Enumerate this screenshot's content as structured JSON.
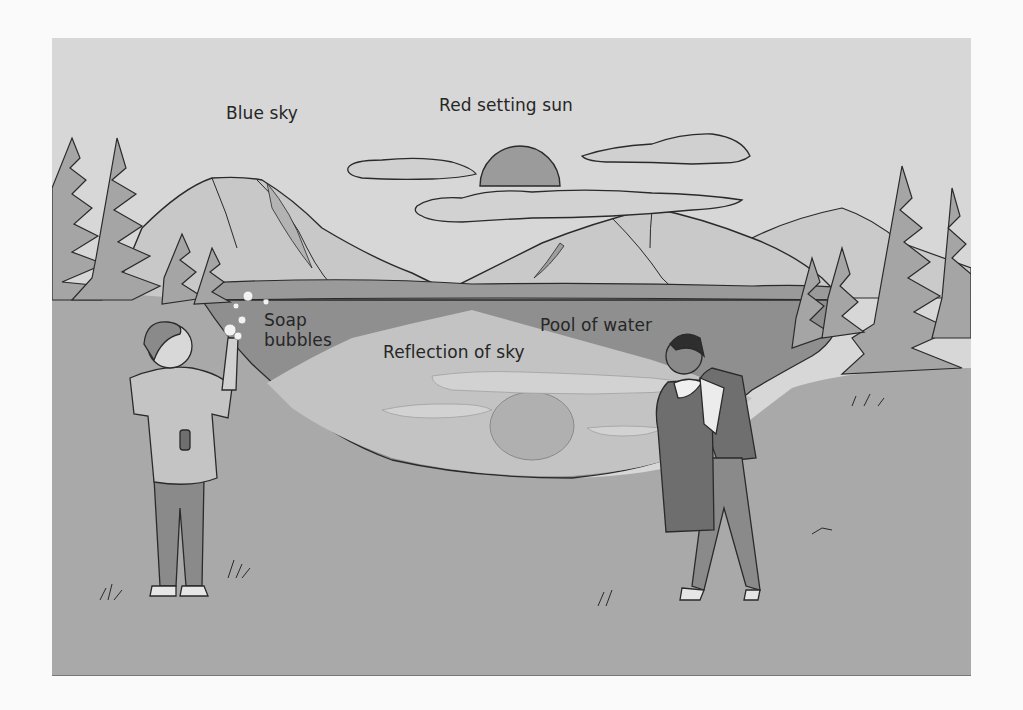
{
  "figure": {
    "labels": {
      "blue_sky": "Blue sky",
      "red_setting_sun": "Red setting sun",
      "soap_bubbles_line1": "Soap",
      "soap_bubbles_line2": "bubbles",
      "pool_of_water": "Pool of water",
      "reflection_of_sky": "Reflection of sky"
    },
    "colors": {
      "page_background": "#fafafa",
      "sky": "#d6d6d6",
      "sun": "#9a9a9a",
      "cloud": "#cfcfcf",
      "mountain": "#c6c6c6",
      "trees": "#a6a6a6",
      "pool": "#8f8f8f",
      "reflection": "#c2c2c2",
      "ground": "#a8a8a8",
      "outline": "#2a2a2a",
      "label_text": "#262626"
    }
  }
}
